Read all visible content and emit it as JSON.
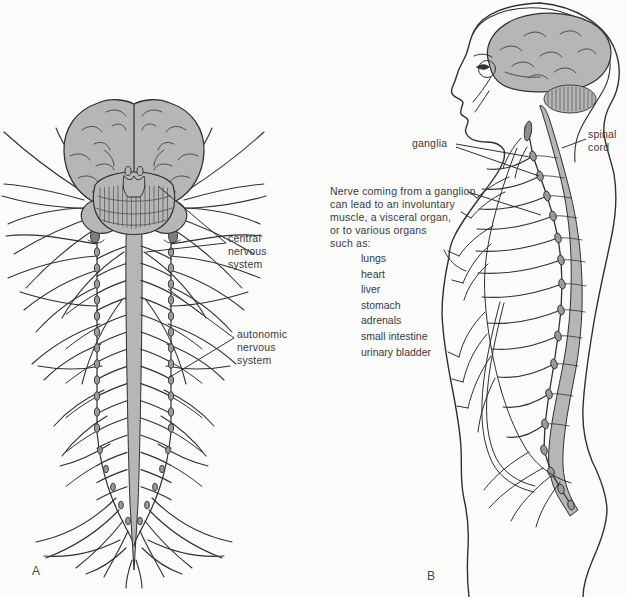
{
  "figure": {
    "background": "#fbfbfa",
    "ink_color": "#303030",
    "brain_gray": "#b6b6b6",
    "panel_a": {
      "letter": "A",
      "central_label": "central\nnervous\nsystem",
      "autonomic_label": "autonomic\nnervous\nsystem"
    },
    "panel_b": {
      "letter": "B",
      "ganglia_label": "ganglia",
      "spinal_cord_label": "spinal\ncord",
      "note": "Nerve coming from a ganglion\ncan lead to an involuntary\nmuscle, a visceral organ,\nor to various organs\nsuch as:",
      "organs": [
        "lungs",
        "heart",
        "liver",
        "stomach",
        "adrenals",
        "small intestine",
        "urinary bladder"
      ]
    }
  }
}
